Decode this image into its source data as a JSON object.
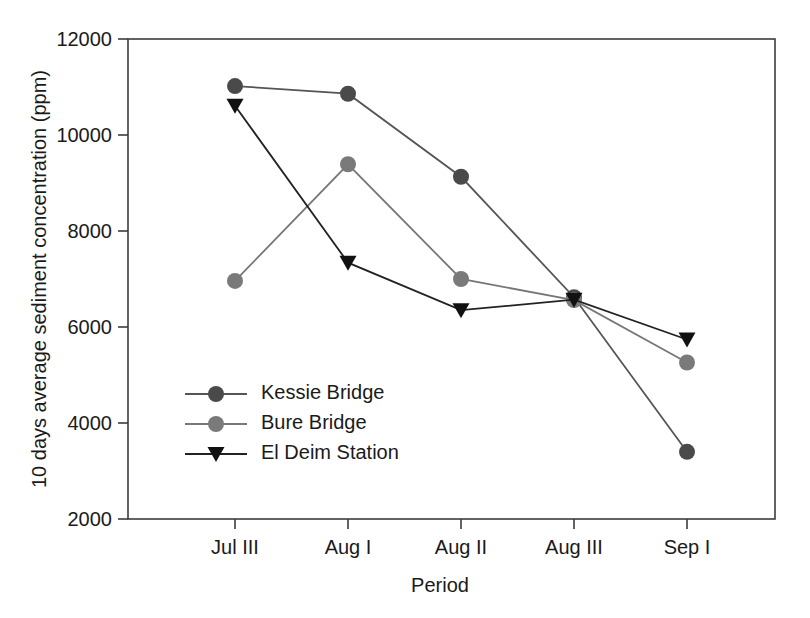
{
  "chart_data": {
    "type": "line",
    "title": "",
    "xlabel": "Period",
    "ylabel": "10 days average sediment concentration (ppm)",
    "categories": [
      "Jul III",
      "Aug I",
      "Aug II",
      "Aug III",
      "Sep I"
    ],
    "ylim": [
      2000,
      12000
    ],
    "ytick_labels": [
      "12000",
      "10000",
      "8000",
      "6000",
      "4000",
      "2000"
    ],
    "ytick_values": [
      12000,
      10000,
      8000,
      6000,
      4000,
      2000
    ],
    "grid": false,
    "legend_position": "inside-lower-left",
    "series": [
      {
        "name": "Kessie Bridge",
        "marker": "circle",
        "color": "#4a4a4a",
        "line_color": "#555555",
        "values": [
          11020,
          10860,
          9130,
          6620,
          3400
        ]
      },
      {
        "name": "Bure Bridge",
        "marker": "circle",
        "color": "#7a7a7a",
        "line_color": "#777777",
        "values": [
          6960,
          9390,
          7000,
          6560,
          5260
        ]
      },
      {
        "name": "El Deim Station",
        "marker": "triangle-down",
        "color": "#111111",
        "line_color": "#222222",
        "values": [
          10610,
          7340,
          6350,
          6570,
          5740
        ]
      }
    ]
  }
}
